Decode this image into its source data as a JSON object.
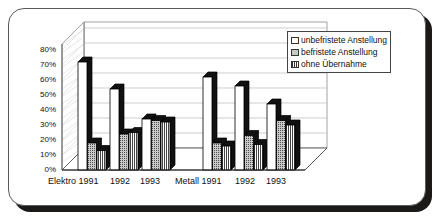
{
  "chart_data": {
    "type": "bar",
    "title": "",
    "subtitle": "",
    "xlabel": "",
    "ylabel": "",
    "ylim": [
      0,
      80
    ],
    "ytick_labels": [
      "80%",
      "70%",
      "60%",
      "50%",
      "40%",
      "30%",
      "20%",
      "10%",
      "0%"
    ],
    "ytick_values": [
      80,
      70,
      60,
      50,
      40,
      30,
      20,
      10,
      0
    ],
    "grid": true,
    "legend_position": "top-right",
    "three_d": true,
    "categories": [
      "Elektro 1991",
      "1992",
      "1993",
      "Metall 1991",
      "1992",
      "1993"
    ],
    "group_labels": [
      "Elektro 1991 1992 1993",
      "Metall 1991 1992 1993"
    ],
    "series": [
      {
        "name": "unbefristete Anstellung",
        "pattern": "white",
        "values": [
          72,
          54,
          34,
          62,
          56,
          44
        ]
      },
      {
        "name": "befristete Anstellung",
        "pattern": "dotted-gray",
        "values": [
          18,
          24,
          33,
          18,
          23,
          33
        ]
      },
      {
        "name": "ohne Übernahme",
        "pattern": "vertical-hatch",
        "values": [
          13,
          25,
          32,
          16,
          17,
          30
        ]
      }
    ]
  },
  "legend": {
    "items": [
      {
        "label": "unbefristete Anstellung",
        "swatch": "white-swatch-icon"
      },
      {
        "label": "befristete Anstellung",
        "swatch": "dotted-swatch-icon"
      },
      {
        "label": "ohne Übernahme",
        "swatch": "hatched-swatch-icon"
      }
    ]
  },
  "axis": {
    "x_labels": [
      {
        "text": "Elektro 1991",
        "x": 48
      },
      {
        "text": "1992",
        "x": 110
      },
      {
        "text": "1993",
        "x": 140
      },
      {
        "text": "Metall 1991",
        "x": 175
      },
      {
        "text": "1992",
        "x": 235
      },
      {
        "text": "1993",
        "x": 266
      }
    ]
  },
  "colors": {
    "bar_white": "#ffffff",
    "bar_dotted": "#c9c9c9",
    "bar_hatch": "#ffffff",
    "bar_side": "#111111",
    "outline": "#000000",
    "grid": "#b9b9b9",
    "frame_border": "#5a5a5a",
    "shadow": "#1c1a18",
    "background": "#ffffff",
    "text": "#111111"
  }
}
